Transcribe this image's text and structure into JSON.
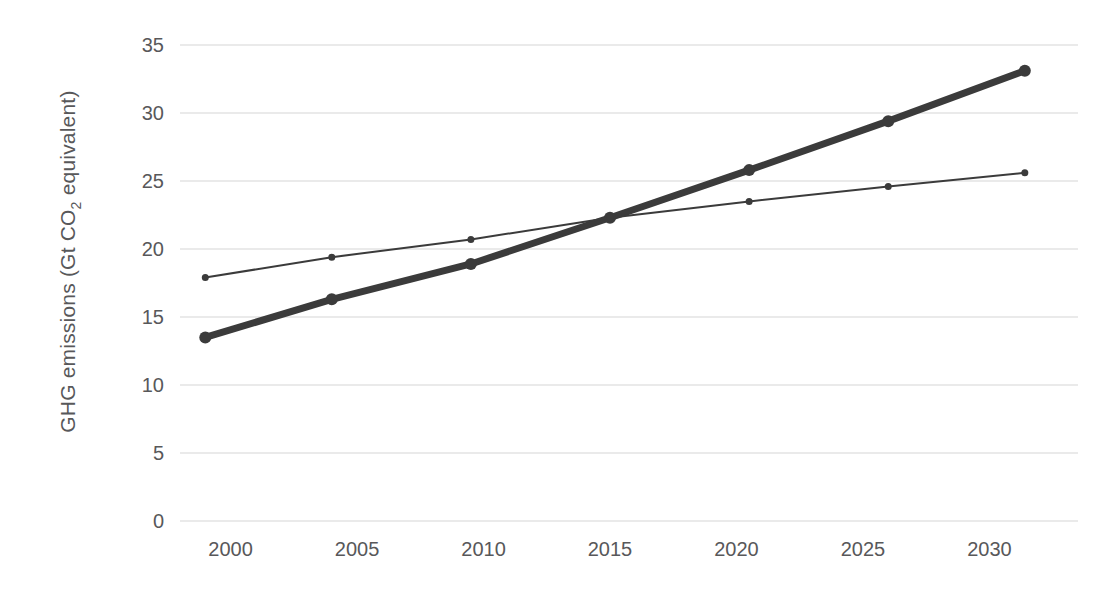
{
  "chart_data": {
    "type": "line",
    "title": "",
    "xlabel": "",
    "ylabel": "GHG emissions (Gt CO2 equivalent)",
    "ylabel_parts": {
      "before": "GHG emissions (Gt CO",
      "sub": "2",
      "after": " equivalent)"
    },
    "x": [
      1999,
      2004,
      2009.5,
      2015,
      2020.5,
      2026,
      2031.4
    ],
    "xlim": [
      1998,
      2032
    ],
    "ylim": [
      0,
      35
    ],
    "xticks": [
      2000,
      2005,
      2010,
      2015,
      2020,
      2025,
      2030
    ],
    "xticklabels": [
      "2000",
      "2005",
      "2010",
      "2015",
      "2020",
      "2025",
      "2030"
    ],
    "yticks": [
      0,
      5,
      10,
      15,
      20,
      25,
      30,
      35
    ],
    "yticklabels": [
      "0",
      "5",
      "10",
      "15",
      "20",
      "25",
      "30",
      "35"
    ],
    "grid": true,
    "grid_axis": "y",
    "grid_color": "#e3e3e3",
    "legend": "none",
    "series": [
      {
        "name": "thick-series",
        "style": "thick",
        "color": "#3b3b3b",
        "linewidth": 7,
        "marker_radius": 6,
        "values": [
          13.5,
          16.3,
          18.9,
          22.3,
          25.8,
          29.4,
          33.1
        ]
      },
      {
        "name": "thin-series",
        "style": "thin",
        "color": "#3b3b3b",
        "linewidth": 2,
        "marker_radius": 3.5,
        "values": [
          17.9,
          19.4,
          20.7,
          22.3,
          23.5,
          24.6,
          25.6
        ]
      }
    ]
  },
  "plot_geometry": {
    "left": 180,
    "right": 1040,
    "top": 45,
    "bottom": 521
  },
  "colors": {
    "text": "#58585a",
    "grid": "#e3e3e3",
    "line": "#3b3b3b",
    "background": "#ffffff"
  }
}
